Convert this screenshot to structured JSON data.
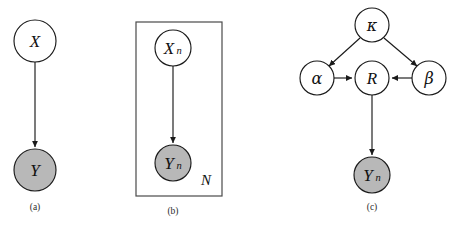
{
  "figure": {
    "background_color": "#ffffff",
    "stroke_color": "#1a1a1a",
    "observed_fill_color": "#b8b8b8",
    "latent_fill_color": "#ffffff",
    "panels": [
      {
        "id": "a",
        "caption": "(a)",
        "caption_x": 35,
        "caption_y": 207,
        "nodes": [
          {
            "id": "X",
            "label": "X",
            "subscript": "",
            "cx": 35,
            "cy": 41,
            "r": 21,
            "shaded": false,
            "label_kind": "latin"
          },
          {
            "id": "Y",
            "label": "Y",
            "subscript": "",
            "cx": 35,
            "cy": 170,
            "r": 21,
            "shaded": true,
            "label_kind": "latin"
          }
        ],
        "edges": [
          {
            "from": "X",
            "to": "Y",
            "x1": 35,
            "y1": 62,
            "x2": 35,
            "y2": 147
          }
        ],
        "plate": null
      },
      {
        "id": "b",
        "caption": "(b)",
        "caption_x": 173,
        "caption_y": 211,
        "nodes": [
          {
            "id": "Xn",
            "label": "X",
            "subscript": "n",
            "cx": 173,
            "cy": 48,
            "r": 18,
            "shaded": false,
            "label_kind": "latin"
          },
          {
            "id": "Yn",
            "label": "Y",
            "subscript": "n",
            "cx": 173,
            "cy": 163,
            "r": 18,
            "shaded": true,
            "label_kind": "latin"
          }
        ],
        "edges": [
          {
            "from": "Xn",
            "to": "Yn",
            "x1": 173,
            "y1": 66,
            "x2": 173,
            "y2": 143
          }
        ],
        "plate": {
          "label": "N",
          "x": 136,
          "y": 22,
          "width": 86,
          "height": 174,
          "label_x": 206,
          "label_y": 180
        }
      },
      {
        "id": "c",
        "caption": "(c)",
        "caption_x": 372,
        "caption_y": 207,
        "nodes": [
          {
            "id": "kappa",
            "label": "κ",
            "subscript": "",
            "cx": 372,
            "cy": 25,
            "r": 17,
            "shaded": false,
            "label_kind": "greek"
          },
          {
            "id": "alpha",
            "label": "α",
            "subscript": "",
            "cx": 317,
            "cy": 78,
            "r": 17,
            "shaded": false,
            "label_kind": "greek"
          },
          {
            "id": "R",
            "label": "R",
            "subscript": "",
            "cx": 372,
            "cy": 78,
            "r": 17,
            "shaded": false,
            "label_kind": "latin"
          },
          {
            "id": "beta",
            "label": "β",
            "subscript": "",
            "cx": 429,
            "cy": 78,
            "r": 17,
            "shaded": false,
            "label_kind": "greek"
          },
          {
            "id": "Yn_c",
            "label": "Y",
            "subscript": "n",
            "cx": 372,
            "cy": 175,
            "r": 18,
            "shaded": true,
            "label_kind": "latin"
          }
        ],
        "edges": [
          {
            "from": "kappa",
            "to": "alpha",
            "x1": 360,
            "y1": 38,
            "x2": 329,
            "y2": 66
          },
          {
            "from": "kappa",
            "to": "beta",
            "x1": 384,
            "y1": 38,
            "x2": 417,
            "y2": 66
          },
          {
            "from": "alpha",
            "to": "R",
            "x1": 334,
            "y1": 78,
            "x2": 352,
            "y2": 78
          },
          {
            "from": "beta",
            "to": "R",
            "x1": 412,
            "y1": 78,
            "x2": 392,
            "y2": 78
          },
          {
            "from": "R",
            "to": "Yn_c",
            "x1": 372,
            "y1": 95,
            "x2": 372,
            "y2": 155
          }
        ],
        "plate": null
      }
    ]
  }
}
